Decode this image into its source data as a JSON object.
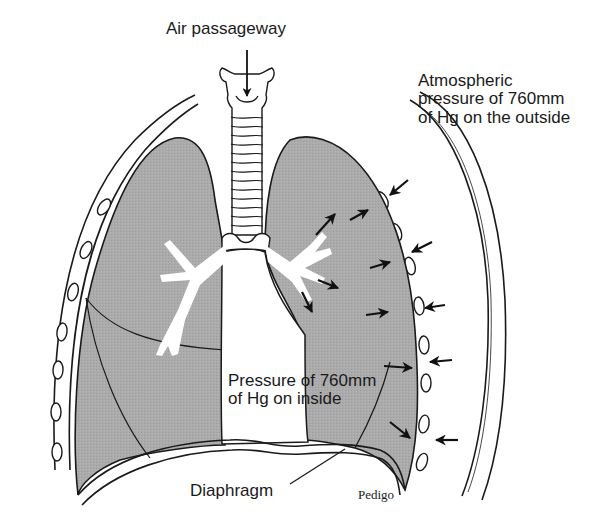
{
  "figure": {
    "type": "anatomical-diagram",
    "colors": {
      "lung_fill": "#a9a9a9",
      "outline": "#1a1a1a",
      "background": "#ffffff",
      "airway": "#ffffff"
    }
  },
  "labels": {
    "air_passageway": "Air passageway",
    "atmospheric": {
      "line1": "Atmospheric",
      "line2": "pressure of 760mm",
      "line3": "of Hg on the outside"
    },
    "inside": {
      "line1": "Pressure of 760mm",
      "line2": "of Hg on inside"
    },
    "diaphragm": "Diaphragm",
    "credit": "Pedigo"
  },
  "arrows": {
    "outside_inward_count": 5,
    "inside_outward_count": 8
  }
}
